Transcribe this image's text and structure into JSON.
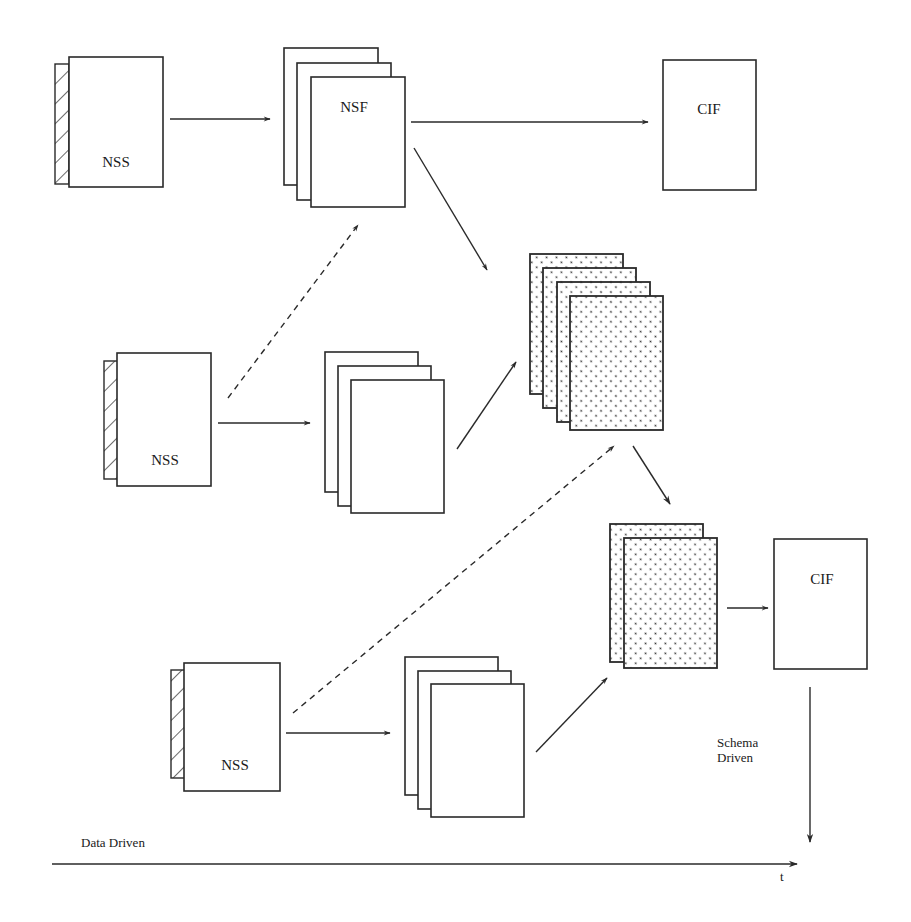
{
  "diagram": {
    "rows": [
      {
        "id": "row-1",
        "source": {
          "type": "NSS",
          "label": "NSS"
        },
        "intermediate": {
          "type": "NSF",
          "label": "NSF",
          "stack_count": 3
        },
        "target": {
          "type": "CIF",
          "label": "CIF"
        }
      },
      {
        "id": "row-2",
        "source": {
          "type": "NSS",
          "label": "NSS"
        },
        "intermediate": {
          "label": "",
          "stack_count": 3
        }
      },
      {
        "id": "row-3",
        "source": {
          "type": "NSS",
          "label": "NSS"
        },
        "intermediate": {
          "label": "",
          "stack_count": 3
        }
      }
    ],
    "merged_stacks": [
      {
        "id": "merge-top",
        "pattern": "dotted-diagonal",
        "stack_count": 4
      },
      {
        "id": "merge-bottom",
        "pattern": "dotted-diagonal",
        "stack_count": 2
      }
    ],
    "final_target": {
      "label": "CIF"
    },
    "axes": {
      "horizontal": {
        "label": "Data Driven",
        "end_label": "t"
      },
      "vertical": {
        "label_line1": "Schema",
        "label_line2": "Driven"
      }
    },
    "edges": [
      {
        "from": "NSS-1",
        "to": "NSF",
        "style": "solid"
      },
      {
        "from": "NSF",
        "to": "CIF-1",
        "style": "solid"
      },
      {
        "from": "NSF",
        "to": "merge-top",
        "style": "solid"
      },
      {
        "from": "NSS-2",
        "to": "NSF",
        "style": "dashed"
      },
      {
        "from": "NSS-2",
        "to": "stack-2",
        "style": "solid"
      },
      {
        "from": "stack-2",
        "to": "merge-top",
        "style": "solid"
      },
      {
        "from": "NSS-3",
        "to": "merge-top",
        "style": "dashed"
      },
      {
        "from": "NSS-3",
        "to": "stack-3",
        "style": "solid"
      },
      {
        "from": "stack-3",
        "to": "merge-bottom",
        "style": "solid"
      },
      {
        "from": "merge-top",
        "to": "merge-bottom",
        "style": "solid"
      },
      {
        "from": "merge-bottom",
        "to": "CIF-2",
        "style": "solid"
      }
    ]
  }
}
